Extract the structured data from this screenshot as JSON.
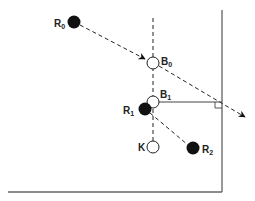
{
  "diagram": {
    "nodes": [
      {
        "id": "R0",
        "label": "R",
        "sub": "0",
        "type": "filled",
        "x": 74,
        "y": 22
      },
      {
        "id": "B0",
        "label": "B",
        "sub": "0",
        "type": "open",
        "x": 153,
        "y": 63
      },
      {
        "id": "B1",
        "label": "B",
        "sub": "1",
        "type": "open",
        "x": 153,
        "y": 102
      },
      {
        "id": "R1",
        "label": "R",
        "sub": "1",
        "type": "filled",
        "x": 145,
        "y": 109
      },
      {
        "id": "K",
        "label": "K",
        "sub": "",
        "type": "open",
        "x": 153,
        "y": 147
      },
      {
        "id": "R2",
        "label": "R",
        "sub": "2",
        "type": "filled",
        "x": 193,
        "y": 148
      }
    ],
    "edges": [
      {
        "from": "R0",
        "to": "B0",
        "style": "dashed",
        "arrow": true
      },
      {
        "from": "B0",
        "to": "off-frame",
        "style": "dashed",
        "arrow": true
      },
      {
        "from": "B0",
        "to": "K",
        "style": "dashed",
        "arrow": false,
        "note": "vertical axis"
      },
      {
        "from": "B1",
        "to": "frame-right",
        "style": "solid",
        "arrow": false,
        "note": "perpendicular, right-angle mark"
      },
      {
        "from": "R1",
        "to": "R2",
        "style": "dashed",
        "arrow": false
      }
    ],
    "labels": {
      "R0": "R",
      "R0_sub": "0",
      "B0": "B",
      "B0_sub": "0",
      "B1": "B",
      "B1_sub": "1",
      "R1": "R",
      "R1_sub": "1",
      "K": "K",
      "R2": "R",
      "R2_sub": "2"
    },
    "colors": {
      "ink": "#111111",
      "frame": "#555555",
      "background": "#ffffff"
    }
  }
}
